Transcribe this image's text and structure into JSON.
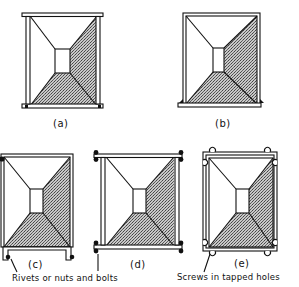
{
  "figure": {
    "colors": {
      "line": "#111111",
      "hatch_fill": "#9a9a9a",
      "background": "#ffffff"
    },
    "panels": [
      {
        "id": "a",
        "label": "(a)",
        "description": "Frame with top and bottom flange bars, vertical posts inside"
      },
      {
        "id": "b",
        "label": "(b)",
        "description": "Rectangular frame on a base plate"
      },
      {
        "id": "c",
        "label": "(c)",
        "description": "Frame with bottom channel fastened by rivets or nuts and bolts"
      },
      {
        "id": "d",
        "label": "(d)",
        "description": "Frame with flanged top and bottom, bolted at corners"
      },
      {
        "id": "e",
        "label": "(e)",
        "description": "Double-walled frame with corner screws"
      }
    ],
    "annotations": [
      {
        "text": "Rivets or nuts and bolts",
        "points_to": [
          "c",
          "d"
        ]
      },
      {
        "text": "Screws in tapped holes",
        "points_to": [
          "e"
        ]
      }
    ]
  }
}
